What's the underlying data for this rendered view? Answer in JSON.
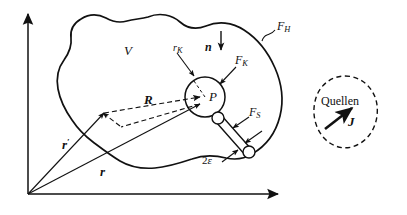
{
  "figure": {
    "kind": "physics-vector-diagram",
    "background_color": "#ffffff",
    "line_color": "#111111"
  },
  "labels": {
    "volume": {
      "main": "V",
      "sub": ""
    },
    "outer_surface": {
      "main": "F",
      "sub": "H"
    },
    "sphere_surface": {
      "main": "F",
      "sub": "K"
    },
    "tube_surface": {
      "main": "F",
      "sub": "S"
    },
    "sphere_radius": {
      "pre": "r",
      "main": "",
      "sub": "K"
    },
    "normal_vector": {
      "main": "n",
      "sub": ""
    },
    "point": {
      "main": "P",
      "sub": ""
    },
    "vector_R": {
      "main": "R",
      "sub": ""
    },
    "vector_r": {
      "main": "r",
      "sub": ""
    },
    "vector_r_prime": {
      "main": "r",
      "sub": "",
      "prime": "′"
    },
    "tube_width": {
      "main": "2",
      "greek": "ε"
    },
    "sources_region": {
      "main": "Quellen"
    },
    "current_density": {
      "main": "J"
    }
  },
  "axes": {
    "origin_label": "",
    "vertical_axis": {
      "name": "vertical-axis",
      "arrow": "up"
    },
    "horizontal_axis": {
      "name": "horizontal-axis",
      "arrow": "right"
    }
  },
  "geometry": {
    "origin": {
      "x": 28,
      "y": 194
    },
    "sphere_center": {
      "x": 205,
      "y": 97
    },
    "sphere_radius_px": 20,
    "tube_start": {
      "x": 219,
      "y": 117
    },
    "tube_end": {
      "x": 248,
      "y": 153
    },
    "quellen_center": {
      "x": 345,
      "y": 112
    }
  },
  "colors": {
    "ink": "#111111",
    "paper": "#ffffff"
  }
}
